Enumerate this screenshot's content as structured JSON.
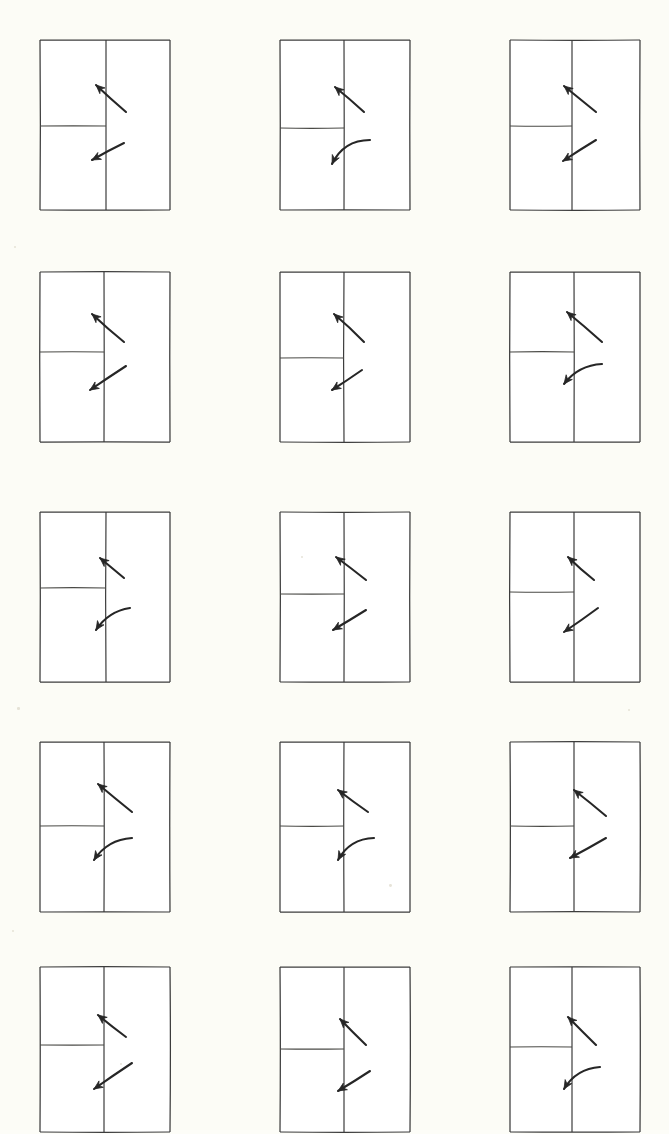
{
  "page": {
    "background_color": "#fcfcf6",
    "width": 669,
    "height": 1130,
    "grid": {
      "columns": 3,
      "rows": 5,
      "total_figures": 15
    }
  },
  "style": {
    "ink_color": "#3c3c3c",
    "arrow_color": "#262626",
    "paper_color": "#ffffff",
    "line_width": 1.25,
    "arrow_width": 2.1
  },
  "layout": {
    "column_x": [
      38,
      278,
      508
    ],
    "row_y": [
      38,
      270,
      510,
      740,
      965
    ],
    "box_width": 130,
    "box_height": 170
  },
  "figures": [
    {
      "id": "figure-r1c1",
      "row": 1,
      "col": 1,
      "x": 38,
      "y": 38,
      "w": 130,
      "h": 170,
      "divider_x": 66,
      "divider_y": 86,
      "divider_h_span": [
        0,
        66
      ],
      "arrow_up": {
        "type": "straight",
        "from": [
          86,
          72
        ],
        "to": [
          56,
          45
        ],
        "curve": 0
      },
      "arrow_down": {
        "type": "straight",
        "from": [
          84,
          103
        ],
        "to": [
          52,
          120
        ],
        "curve": 0
      }
    },
    {
      "id": "figure-r1c2",
      "row": 1,
      "col": 2,
      "x": 278,
      "y": 38,
      "w": 130,
      "h": 170,
      "divider_x": 64,
      "divider_y": 88,
      "divider_h_span": [
        0,
        64
      ],
      "arrow_up": {
        "type": "straight",
        "from": [
          84,
          72
        ],
        "to": [
          55,
          47
        ],
        "curve": 0
      },
      "arrow_down": {
        "type": "curved",
        "from": [
          90,
          100
        ],
        "to": [
          52,
          124
        ],
        "curve": 14
      }
    },
    {
      "id": "figure-r1c3",
      "row": 1,
      "col": 3,
      "x": 508,
      "y": 38,
      "w": 130,
      "h": 170,
      "divider_x": 62,
      "divider_y": 86,
      "divider_h_span": [
        0,
        62
      ],
      "arrow_up": {
        "type": "straight",
        "from": [
          86,
          72
        ],
        "to": [
          54,
          46
        ],
        "curve": 0
      },
      "arrow_down": {
        "type": "straight",
        "from": [
          86,
          100
        ],
        "to": [
          53,
          121
        ],
        "curve": 0
      }
    },
    {
      "id": "figure-r2c1",
      "row": 2,
      "col": 1,
      "x": 38,
      "y": 270,
      "w": 130,
      "h": 170,
      "divider_x": 64,
      "divider_y": 80,
      "divider_h_span": [
        0,
        64
      ],
      "arrow_up": {
        "type": "straight",
        "from": [
          84,
          70
        ],
        "to": [
          52,
          42
        ],
        "curve": 0
      },
      "arrow_down": {
        "type": "straight",
        "from": [
          86,
          94
        ],
        "to": [
          50,
          118
        ],
        "curve": 0
      }
    },
    {
      "id": "figure-r2c2",
      "row": 2,
      "col": 2,
      "x": 278,
      "y": 270,
      "w": 130,
      "h": 170,
      "divider_x": 64,
      "divider_y": 86,
      "divider_h_span": [
        0,
        64
      ],
      "arrow_up": {
        "type": "straight",
        "from": [
          84,
          70
        ],
        "to": [
          54,
          42
        ],
        "curve": 0
      },
      "arrow_down": {
        "type": "straight",
        "from": [
          82,
          98
        ],
        "to": [
          52,
          118
        ],
        "curve": 0
      }
    },
    {
      "id": "figure-r2c3",
      "row": 2,
      "col": 3,
      "x": 508,
      "y": 270,
      "w": 130,
      "h": 170,
      "divider_x": 64,
      "divider_y": 80,
      "divider_h_span": [
        0,
        64
      ],
      "arrow_up": {
        "type": "straight",
        "from": [
          92,
          70
        ],
        "to": [
          57,
          40
        ],
        "curve": 0
      },
      "arrow_down": {
        "type": "curved",
        "from": [
          92,
          92
        ],
        "to": [
          54,
          112
        ],
        "curve": 10
      }
    },
    {
      "id": "figure-r3c1",
      "row": 3,
      "col": 1,
      "x": 38,
      "y": 510,
      "w": 130,
      "h": 170,
      "divider_x": 66,
      "divider_y": 76,
      "divider_h_span": [
        0,
        66
      ],
      "arrow_up": {
        "type": "straight",
        "from": [
          84,
          66
        ],
        "to": [
          60,
          46
        ],
        "curve": 0
      },
      "arrow_down": {
        "type": "curved",
        "from": [
          90,
          96
        ],
        "to": [
          56,
          118
        ],
        "curve": 9
      }
    },
    {
      "id": "figure-r3c2",
      "row": 3,
      "col": 2,
      "x": 278,
      "y": 510,
      "w": 130,
      "h": 170,
      "divider_x": 64,
      "divider_y": 82,
      "divider_h_span": [
        0,
        64
      ],
      "arrow_up": {
        "type": "straight",
        "from": [
          86,
          68
        ],
        "to": [
          56,
          45
        ],
        "curve": 0
      },
      "arrow_down": {
        "type": "straight",
        "from": [
          86,
          98
        ],
        "to": [
          53,
          118
        ],
        "curve": 0
      }
    },
    {
      "id": "figure-r3c3",
      "row": 3,
      "col": 3,
      "x": 508,
      "y": 510,
      "w": 130,
      "h": 170,
      "divider_x": 64,
      "divider_y": 80,
      "divider_h_span": [
        0,
        64
      ],
      "arrow_up": {
        "type": "straight",
        "from": [
          84,
          68
        ],
        "to": [
          58,
          45
        ],
        "curve": 0
      },
      "arrow_down": {
        "type": "straight",
        "from": [
          88,
          96
        ],
        "to": [
          54,
          120
        ],
        "curve": 0
      }
    },
    {
      "id": "figure-r4c1",
      "row": 4,
      "col": 1,
      "x": 38,
      "y": 740,
      "w": 130,
      "h": 170,
      "divider_x": 64,
      "divider_y": 84,
      "divider_h_span": [
        0,
        64
      ],
      "arrow_up": {
        "type": "straight",
        "from": [
          92,
          70
        ],
        "to": [
          58,
          42
        ],
        "curve": 0
      },
      "arrow_down": {
        "type": "curved",
        "from": [
          92,
          96
        ],
        "to": [
          54,
          118
        ],
        "curve": 11
      }
    },
    {
      "id": "figure-r4c2",
      "row": 4,
      "col": 2,
      "x": 278,
      "y": 740,
      "w": 130,
      "h": 170,
      "divider_x": 64,
      "divider_y": 84,
      "divider_h_span": [
        0,
        64
      ],
      "arrow_up": {
        "type": "straight",
        "from": [
          88,
          70
        ],
        "to": [
          58,
          48
        ],
        "curve": 0
      },
      "arrow_down": {
        "type": "curved",
        "from": [
          94,
          96
        ],
        "to": [
          58,
          118
        ],
        "curve": 12
      }
    },
    {
      "id": "figure-r4c3",
      "row": 4,
      "col": 3,
      "x": 508,
      "y": 740,
      "w": 130,
      "h": 170,
      "divider_x": 64,
      "divider_y": 84,
      "divider_h_span": [
        0,
        64
      ],
      "arrow_up": {
        "type": "straight",
        "from": [
          96,
          74
        ],
        "to": [
          64,
          48
        ],
        "curve": 0
      },
      "arrow_down": {
        "type": "straight",
        "from": [
          96,
          96
        ],
        "to": [
          60,
          116
        ],
        "curve": 0
      }
    },
    {
      "id": "figure-r5c1",
      "row": 5,
      "col": 1,
      "x": 38,
      "y": 965,
      "w": 130,
      "h": 165,
      "divider_x": 64,
      "divider_y": 78,
      "divider_h_span": [
        0,
        64
      ],
      "arrow_up": {
        "type": "straight",
        "from": [
          86,
          70
        ],
        "to": [
          58,
          48
        ],
        "curve": 0
      },
      "arrow_down": {
        "type": "straight",
        "from": [
          92,
          96
        ],
        "to": [
          54,
          122
        ],
        "curve": 0
      }
    },
    {
      "id": "figure-r5c2",
      "row": 5,
      "col": 2,
      "x": 278,
      "y": 965,
      "w": 130,
      "h": 165,
      "divider_x": 64,
      "divider_y": 82,
      "divider_h_span": [
        0,
        64
      ],
      "arrow_up": {
        "type": "straight",
        "from": [
          86,
          78
        ],
        "to": [
          60,
          52
        ],
        "curve": 0
      },
      "arrow_down": {
        "type": "straight",
        "from": [
          90,
          104
        ],
        "to": [
          58,
          124
        ],
        "curve": 0
      }
    },
    {
      "id": "figure-r5c3",
      "row": 5,
      "col": 3,
      "x": 508,
      "y": 965,
      "w": 130,
      "h": 165,
      "divider_x": 62,
      "divider_y": 80,
      "divider_h_span": [
        0,
        62
      ],
      "arrow_up": {
        "type": "straight",
        "from": [
          86,
          78
        ],
        "to": [
          58,
          50
        ],
        "curve": 0
      },
      "arrow_down": {
        "type": "curved",
        "from": [
          90,
          100
        ],
        "to": [
          54,
          122
        ],
        "curve": 11
      }
    }
  ],
  "specks": [
    {
      "x": 14,
      "y": 246,
      "r": 1.2
    },
    {
      "x": 17,
      "y": 707,
      "r": 1.3
    },
    {
      "x": 12,
      "y": 930,
      "r": 1.1
    },
    {
      "x": 389,
      "y": 884,
      "r": 1.4
    },
    {
      "x": 628,
      "y": 709,
      "r": 1.2
    },
    {
      "x": 301,
      "y": 556,
      "r": 1.0
    },
    {
      "x": 120,
      "y": 1063,
      "r": 1.0
    }
  ]
}
